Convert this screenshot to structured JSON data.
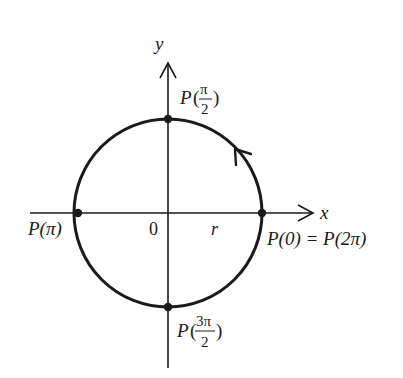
{
  "diagram": {
    "colors": {
      "stroke": "#1a1a1a",
      "background": "#ffffff"
    },
    "axes": {
      "x_label": "x",
      "y_label": "y",
      "origin_label": "0",
      "radius_label": "r"
    },
    "points": [
      {
        "id": "top",
        "label_prefix": "P(",
        "num": "π",
        "den": "2",
        "label_suffix": ")"
      },
      {
        "id": "left",
        "label": "P(π)"
      },
      {
        "id": "right",
        "label": "P(0) = P(2π)"
      },
      {
        "id": "bottom",
        "label_prefix": "P(",
        "num": "3π",
        "den": "2",
        "label_suffix": ")"
      }
    ],
    "direction": "counterclockwise"
  }
}
